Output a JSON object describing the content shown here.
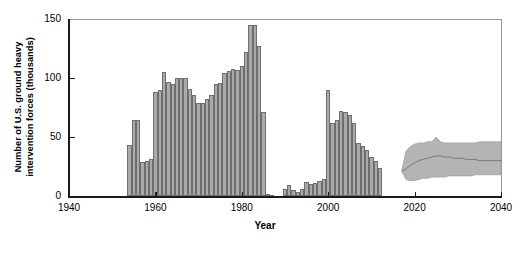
{
  "chart_data": {
    "type": "bar",
    "title": "",
    "xlabel": "Year",
    "ylabel": "Number of U.S. ground heavy intervention forces (thousands)",
    "xlim": [
      1940,
      2040
    ],
    "ylim": [
      0,
      150
    ],
    "xticks": [
      1940,
      1960,
      1980,
      2000,
      2020,
      2040
    ],
    "yticks": [
      0,
      50,
      100,
      150
    ],
    "grid": false,
    "legend": null,
    "series": [
      {
        "name": "Historical U.S. ground heavy intervention forces",
        "type": "bar",
        "x": [
          1954,
          1955,
          1956,
          1957,
          1958,
          1959,
          1960,
          1961,
          1962,
          1963,
          1964,
          1965,
          1966,
          1967,
          1968,
          1969,
          1970,
          1971,
          1972,
          1973,
          1974,
          1975,
          1976,
          1977,
          1978,
          1979,
          1980,
          1981,
          1982,
          1983,
          1984,
          1985,
          1986,
          1987,
          1988,
          1989,
          1990,
          1991,
          1992,
          1993,
          1994,
          1995,
          1996,
          1997,
          1998,
          1999,
          2000,
          2001,
          2002,
          2003,
          2004,
          2005,
          2006,
          2007,
          2008,
          2009,
          2010,
          2011,
          2012,
          2013,
          2014,
          2015,
          2016
        ],
        "values": [
          43,
          64,
          64,
          29,
          30,
          31,
          88,
          90,
          105,
          97,
          95,
          100,
          100,
          100,
          91,
          86,
          79,
          79,
          82,
          86,
          95,
          96,
          104,
          106,
          108,
          107,
          110,
          122,
          145,
          145,
          127,
          71,
          2,
          1,
          0,
          0,
          6,
          9,
          5,
          3,
          6,
          12,
          10,
          11,
          13,
          14,
          90,
          62,
          64,
          72,
          71,
          69,
          62,
          45,
          42,
          39,
          33,
          30,
          24,
          0,
          0,
          0,
          0
        ]
      },
      {
        "name": "Projected range (80% band)",
        "type": "band",
        "x": [
          2017,
          2018,
          2019,
          2020,
          2021,
          2022,
          2023,
          2024,
          2025,
          2026,
          2027,
          2028,
          2029,
          2030,
          2031,
          2032,
          2033,
          2034,
          2035,
          2036,
          2037,
          2038,
          2039,
          2040
        ],
        "lower": [
          21,
          14,
          13,
          13,
          14,
          15,
          15,
          16,
          16,
          16,
          16,
          17,
          17,
          17,
          17,
          17,
          17,
          18,
          18,
          18,
          18,
          18,
          18,
          18
        ],
        "upper": [
          21,
          38,
          42,
          44,
          45,
          45,
          46,
          46,
          50,
          46,
          45,
          45,
          45,
          45,
          45,
          45,
          45,
          45,
          46,
          46,
          46,
          46,
          46,
          46
        ]
      },
      {
        "name": "Projected median",
        "type": "line",
        "x": [
          2017,
          2018,
          2019,
          2020,
          2021,
          2022,
          2023,
          2024,
          2025,
          2026,
          2027,
          2028,
          2029,
          2030,
          2031,
          2032,
          2033,
          2034,
          2035,
          2036,
          2037,
          2038,
          2039,
          2040
        ],
        "values": [
          21,
          23,
          26,
          28,
          30,
          31,
          32,
          33,
          34,
          34,
          33,
          33,
          32,
          32,
          32,
          31,
          31,
          31,
          30,
          30,
          30,
          30,
          30,
          30
        ]
      }
    ],
    "colors": {
      "bar_fill": "#aaaaaa",
      "bar_edge": "#6e6e6e",
      "band_fill": "#b4b4b4",
      "median_line": "#7a7a7a",
      "axis": "#1a1a1a",
      "frame": "#9a9a9a"
    }
  },
  "axes": {
    "y_title": "Number of U.S. ground heavy intervention forces (thousands)",
    "x_title": "Year",
    "y_tick_labels": [
      "150",
      "100",
      "50",
      "0"
    ],
    "x_tick_labels": [
      "1940",
      "1960",
      "1980",
      "2000",
      "2020",
      "2040"
    ]
  }
}
